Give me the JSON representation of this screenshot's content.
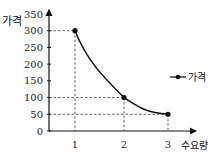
{
  "chart_data": {
    "type": "line",
    "title": "",
    "xlabel": "수요량",
    "ylabel": "가격",
    "x": [
      1,
      2,
      3
    ],
    "series": [
      {
        "name": "가격",
        "values": [
          300,
          100,
          50
        ]
      }
    ],
    "xticks": [
      "1",
      "2",
      "3"
    ],
    "yticks": [
      "0",
      "50",
      "100",
      "150",
      "200",
      "250",
      "300",
      "350"
    ],
    "ylim": [
      0,
      350
    ],
    "xlim": [
      0,
      3.5
    ],
    "grid": false,
    "reference_lines": "dashed guide lines from each point to both axes",
    "legend_position": "right",
    "line_style": "smooth curve with dot markers"
  },
  "labels": {
    "ylabel": "가격",
    "xlabel": "수요량",
    "legend": "가격"
  }
}
